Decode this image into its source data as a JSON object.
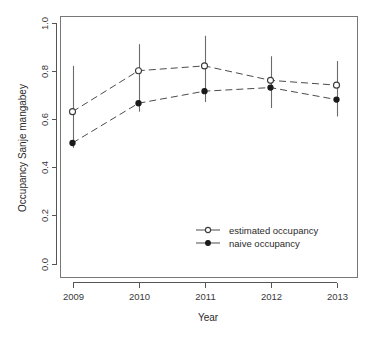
{
  "chart_data": {
    "type": "line",
    "title": "",
    "subtitle": "",
    "xlabel": "Year",
    "ylabel": "Occupancy Sanje mangabey",
    "categories": [
      "2009",
      "2010",
      "2011",
      "2012",
      "2013"
    ],
    "x": [
      2009,
      2010,
      2011,
      2012,
      2013
    ],
    "xlim": [
      2008.7,
      2013.3
    ],
    "ylim": [
      0.0,
      1.0
    ],
    "xticks": [
      "2009",
      "2010",
      "2011",
      "2012",
      "2013"
    ],
    "yticks": [
      "0.0",
      "0.2",
      "0.4",
      "0.6",
      "0.8",
      "1.0"
    ],
    "ytick_values": [
      0.0,
      0.2,
      0.4,
      0.6,
      0.8,
      1.0
    ],
    "grid": false,
    "legend_position": "center-right",
    "series": [
      {
        "name": "estimated occupancy",
        "marker": "open-circle",
        "line": "dashed",
        "values": [
          0.63,
          0.8,
          0.82,
          0.76,
          0.74
        ],
        "error_low": [
          0.48,
          0.63,
          0.67,
          0.645,
          0.61
        ],
        "error_high": [
          0.82,
          0.91,
          0.945,
          0.86,
          0.84
        ]
      },
      {
        "name": "naive occupancy",
        "marker": "filled-circle",
        "line": "dashed",
        "values": [
          0.5,
          0.665,
          0.715,
          0.73,
          0.68
        ],
        "error_low": [
          null,
          null,
          null,
          null,
          null
        ],
        "error_high": [
          null,
          null,
          null,
          null,
          null
        ]
      }
    ],
    "legend": [
      {
        "label": "estimated occupancy",
        "marker": "open-circle"
      },
      {
        "label": "naive occupancy",
        "marker": "filled-circle"
      }
    ],
    "colors": {
      "line": "#4c4c4c",
      "errorbar": "#6b6b6b",
      "open_marker_fill": "#ffffff",
      "filled_marker": "#1a1a1a",
      "axis": "#555555",
      "frame": "#777777",
      "text": "#2b2b2b",
      "background": "#ffffff"
    }
  }
}
